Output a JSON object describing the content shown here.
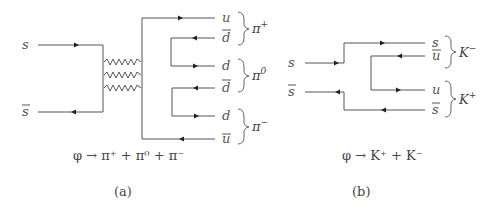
{
  "diagram_a": {
    "incoming": [
      {
        "label": "s",
        "bar": false
      },
      {
        "label": "s",
        "bar": true
      }
    ],
    "outgoing": [
      {
        "label": "u",
        "bar": false
      },
      {
        "label": "d",
        "bar": true
      },
      {
        "label": "d",
        "bar": false
      },
      {
        "label": "d",
        "bar": true
      },
      {
        "label": "d",
        "bar": false
      },
      {
        "label": "u",
        "bar": true
      }
    ],
    "mesons": [
      {
        "name": "π",
        "charge": "+"
      },
      {
        "name": "π",
        "charge": "0"
      },
      {
        "name": "π",
        "charge": "−"
      }
    ],
    "gluons": 3,
    "equation": "φ → π⁺ + π⁰ + π⁻",
    "caption": "(a)"
  },
  "diagram_b": {
    "incoming": [
      {
        "label": "s",
        "bar": false
      },
      {
        "label": "s",
        "bar": true
      }
    ],
    "outgoing": [
      {
        "label": "s",
        "bar": false
      },
      {
        "label": "u",
        "bar": true
      },
      {
        "label": "u",
        "bar": false
      },
      {
        "label": "s",
        "bar": true
      }
    ],
    "mesons": [
      {
        "name": "K",
        "charge": "−"
      },
      {
        "name": "K",
        "charge": "+"
      }
    ],
    "equation": "φ → K⁺ + K⁻",
    "caption": "(b)"
  }
}
